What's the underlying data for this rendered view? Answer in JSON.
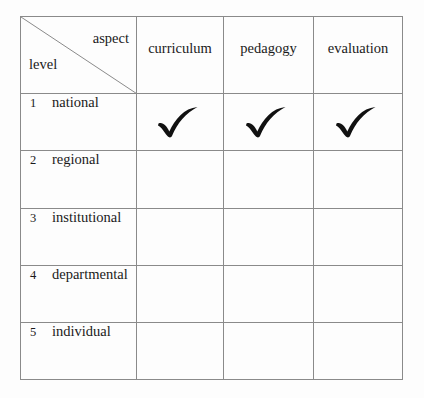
{
  "figure": {
    "corner": {
      "aspect_label": "aspect",
      "level_label": "level",
      "diagonal_icon": "diagonal-divider-line"
    },
    "column_headers": [
      {
        "key": "curriculum",
        "label": "curriculum"
      },
      {
        "key": "pedagogy",
        "label": "pedagogy"
      },
      {
        "key": "evaluation",
        "label": "evaluation"
      }
    ],
    "rows": [
      {
        "number": "1",
        "label": "national",
        "curriculum": "check",
        "pedagogy": "check",
        "evaluation": "check"
      },
      {
        "number": "2",
        "label": "regional",
        "curriculum": "",
        "pedagogy": "",
        "evaluation": ""
      },
      {
        "number": "3",
        "label": "institutional",
        "curriculum": "",
        "pedagogy": "",
        "evaluation": ""
      },
      {
        "number": "4",
        "label": "departmental",
        "curriculum": "",
        "pedagogy": "",
        "evaluation": ""
      },
      {
        "number": "5",
        "label": "individual",
        "curriculum": "",
        "pedagogy": "",
        "evaluation": ""
      }
    ],
    "marks": {
      "check_icon": "check-mark-icon"
    },
    "colors": {
      "background": "#fdfdfd",
      "grid_line": "#8a8a8a",
      "text": "#1a1a1a",
      "check_ink": "#111111"
    }
  }
}
